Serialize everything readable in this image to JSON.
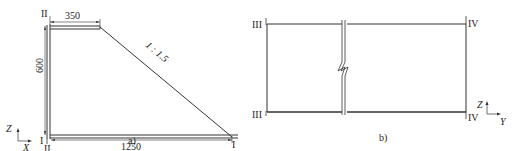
{
  "colors": {
    "line": "#333333",
    "text": "#222222",
    "background": "#ffffff"
  },
  "figure_a": {
    "caption": "a)",
    "section_label_top": "II",
    "section_label_bottom_left_1": "I",
    "section_label_bottom_left_2": "II",
    "section_label_bottom_right": "I",
    "dim_top_width": "350",
    "dim_height": "600",
    "dim_bottom_width": "1250",
    "slope_ratio": "1 : 1.5",
    "axis_vertical": "Z",
    "axis_horizontal": "X"
  },
  "figure_b": {
    "caption": "b)",
    "section_label_left_top": "III",
    "section_label_left_bottom": "III",
    "section_label_right_top": "IV",
    "section_label_right_bottom": "IV",
    "axis_vertical": "Z",
    "axis_horizontal": "Y",
    "break_symbol": "zigzag-break"
  }
}
